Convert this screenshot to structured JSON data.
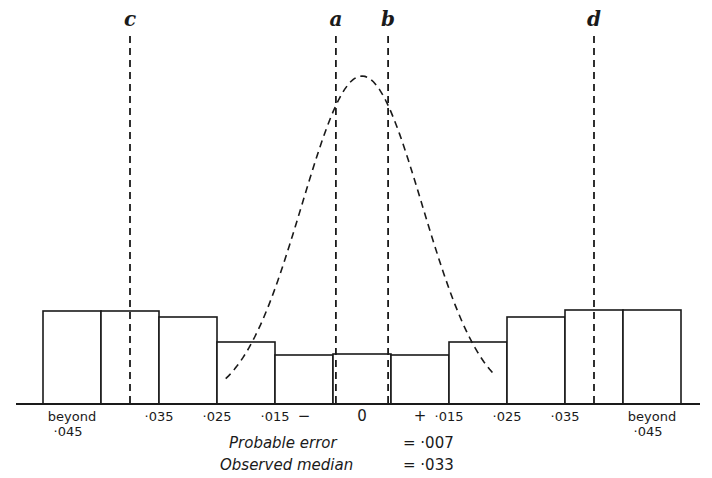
{
  "chart_data": {
    "type": "bar",
    "subtype": "histogram with overlaid normal curve",
    "title": "",
    "xlabel": "",
    "ylabel": "",
    "grid": false,
    "categories": [
      "beyond ·045",
      "·045–·035",
      "·035–·025",
      "·025–·015",
      "·015–·005",
      "− ·005–0",
      "0",
      "+ 0–·005",
      "·005–·015",
      "·015–·025",
      "·025–·035",
      "·035–·045",
      "beyond ·045"
    ],
    "bins": [
      {
        "label": "beyond ·045 (−)",
        "side": "minus",
        "value": 93
      },
      {
        "label": "·045–·035 (−)",
        "side": "minus",
        "value": 93
      },
      {
        "label": "·035–·025 (−)",
        "side": "minus",
        "value": 87
      },
      {
        "label": "·025–·015 (−)",
        "side": "minus",
        "value": 62
      },
      {
        "label": "·015–·005 (−)",
        "side": "minus",
        "value": 49
      },
      {
        "label": "·005 to +·005",
        "side": "center",
        "value": 50
      },
      {
        "label": "·005–·015 (+)",
        "side": "plus",
        "value": 49
      },
      {
        "label": "·015–·025 (+)",
        "side": "plus",
        "value": 62
      },
      {
        "label": "·025–·035 (+)",
        "side": "plus",
        "value": 87
      },
      {
        "label": "·035–·045 (+)",
        "side": "plus",
        "value": 94
      },
      {
        "label": "beyond ·045 (+)",
        "side": "plus",
        "value": 94
      }
    ],
    "value_units": "relative frequency (unlabelled axis)",
    "ylim": [
      0,
      340
    ],
    "tick_labels": [
      {
        "text": "beyond",
        "text2": "·045",
        "at_bin": 0
      },
      {
        "text": "·035",
        "at_edge": 2
      },
      {
        "text": "·025",
        "at_edge": 3
      },
      {
        "text": "·015",
        "at_edge": 4
      },
      {
        "text": "−",
        "at_bin": 4
      },
      {
        "text": "0",
        "at_bin": 5
      },
      {
        "text": "+",
        "at_bin": 6
      },
      {
        "text": "·015",
        "at_edge": 7
      },
      {
        "text": "·025",
        "at_edge": 8
      },
      {
        "text": "·035",
        "at_edge": 9
      },
      {
        "text": "beyond",
        "text2": "·045",
        "at_bin": 10
      }
    ],
    "normal_curve": {
      "style": "dashed",
      "mean": 0,
      "probable_error": 0.007,
      "peak_relative_height": 328
    },
    "reference_lines": [
      {
        "label": "c",
        "position": -0.04,
        "style": "dashed"
      },
      {
        "label": "a",
        "position": -0.0045,
        "style": "dashed"
      },
      {
        "label": "b",
        "position": 0.0045,
        "style": "dashed"
      },
      {
        "label": "d",
        "position": 0.04,
        "style": "dashed"
      }
    ],
    "annotations": [
      {
        "label": "Probable error",
        "value": "= ·007"
      },
      {
        "label": "Observed median",
        "value": "= ·033"
      }
    ]
  }
}
